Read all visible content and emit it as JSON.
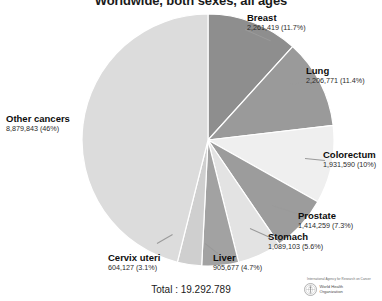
{
  "chart_data": {
    "type": "pie",
    "title": "Worldwide, both sexes, all ages",
    "total_label": "Total : 19.292.789",
    "total_value": 19292789,
    "start_angle_deg": 0,
    "direction": "clockwise",
    "legend": "labels-around-slices",
    "categories": [
      "Breast",
      "Lung",
      "Colorectum",
      "Prostate",
      "Stomach",
      "Liver",
      "Cervix uteri",
      "Other cancers"
    ],
    "values": [
      2261419,
      2206771,
      1931590,
      1414259,
      1089103,
      905677,
      604127,
      8879843
    ],
    "percents": [
      11.7,
      11.4,
      10.0,
      7.3,
      5.6,
      4.7,
      3.1,
      46.0
    ],
    "colors": [
      "#8e8e8e",
      "#9a9a9a",
      "#efefef",
      "#9c9c9c",
      "#e3e3e3",
      "#a2a2a2",
      "#cfcfcf",
      "#dcdcdc"
    ],
    "slices": [
      {
        "name": "Breast",
        "value": "2,261,419",
        "percent": "(11.7%)",
        "value_label": "2,261,419 (11.7%)",
        "pct": 11.7,
        "color": "#8e8e8e"
      },
      {
        "name": "Lung",
        "value": "2,206,771",
        "percent": "(11.4%)",
        "value_label": "2,206,771 (11.4%)",
        "pct": 11.4,
        "color": "#9a9a9a"
      },
      {
        "name": "Colorectum",
        "value": "1,931,590",
        "percent": "(10%)",
        "value_label": "1,931,590 (10%)",
        "pct": 10.0,
        "color": "#efefef"
      },
      {
        "name": "Prostate",
        "value": "1,414,259",
        "percent": "(7.3%)",
        "value_label": "1,414,259 (7.3%)",
        "pct": 7.3,
        "color": "#9c9c9c"
      },
      {
        "name": "Stomach",
        "value": "1,089,103",
        "percent": "(5.6%)",
        "value_label": "1,089,103 (5.6%)",
        "pct": 5.6,
        "color": "#e3e3e3"
      },
      {
        "name": "Liver",
        "value": "905,677",
        "percent": "(4.7%)",
        "value_label": "905,677 (4.7%)",
        "pct": 4.7,
        "color": "#a2a2a2"
      },
      {
        "name": "Cervix uteri",
        "value": "604,127",
        "percent": "(3.1%)",
        "value_label": "604,127 (3.1%)",
        "pct": 3.1,
        "color": "#cfcfcf"
      },
      {
        "name": "Other cancers",
        "value": "8,879,843",
        "percent": "(46%)",
        "value_label": "8,879,843 (46%)",
        "pct": 46.0,
        "color": "#dcdcdc"
      }
    ]
  },
  "footer": {
    "iarc_line": "International Agency for Research on Cancer",
    "who_line1": "World Health",
    "who_line2": "Organization"
  }
}
